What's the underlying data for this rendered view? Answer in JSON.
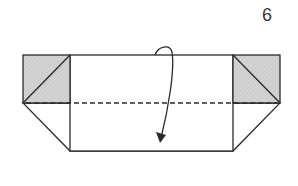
{
  "diagram": {
    "type": "origami-fold-step",
    "step_number": "6",
    "instruction": "valley fold top half down along dashed line",
    "elements": {
      "left_flap": {
        "shape": "square",
        "fill": "shaded",
        "diagonal": "bottom-left to top-right"
      },
      "right_flap": {
        "shape": "square",
        "fill": "shaded",
        "diagonal": "top-left to bottom-right"
      },
      "center_panel": {
        "shape": "rectangle"
      },
      "fold_line": {
        "style": "dashed",
        "kind": "valley-fold"
      },
      "arrow": {
        "direction": "down",
        "kind": "fold-over"
      }
    },
    "colors": {
      "stroke": "#2a2a2a",
      "shade": "#cfcfcf",
      "paper": "#ffffff"
    }
  }
}
